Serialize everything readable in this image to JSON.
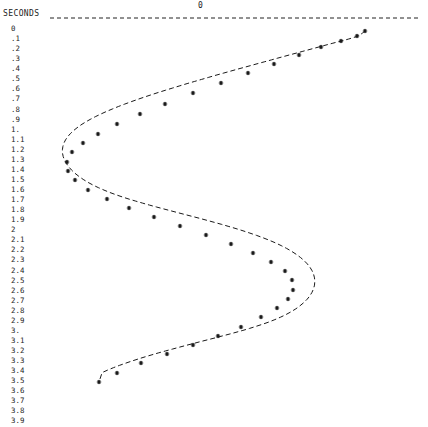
{
  "axis": {
    "y_title": "SECONDS",
    "zero_label": "0",
    "zero_line_y": 18,
    "zero_line_x_start": 50,
    "zero_line_x_end": 420,
    "y_ticks": [
      "0",
      ".1",
      ".2",
      ".3",
      ".4",
      ".5",
      ".6",
      ".7",
      ".8",
      ".9",
      "1.",
      "1.1",
      "1.2",
      "1.3",
      "1.4",
      "1.5",
      "1.6",
      "1.7",
      "1.8",
      "1.9",
      "2",
      "2.1",
      "2.2",
      "2.3",
      "2.4",
      "2.5",
      "2.6",
      "2.7",
      "2.8",
      "2.9",
      "3.",
      "3.1",
      "3.2",
      "3.3",
      "3.4",
      "3.5",
      "3.6",
      "3.7",
      "3.8",
      "3.9"
    ]
  },
  "colors": {
    "ink": "#232323",
    "background": "#ffffff",
    "curve": "#1a1a1a"
  },
  "chart_data": {
    "type": "line",
    "title": "",
    "xlabel": "",
    "ylabel": "SECONDS",
    "orientation": "vertical-time-axis",
    "marker": "asterisk",
    "line_style": "dashed",
    "grid": false,
    "legend": false,
    "note": "Damped sinusoid: amplitude on horizontal axis, time (seconds) increasing downward. Zero reference is the dashed line at top.",
    "xlim": [
      -1.0,
      1.0
    ],
    "ylim": [
      0,
      3.9
    ],
    "x": [
      0.0,
      0.1,
      0.2,
      0.3,
      0.4,
      0.5,
      0.6,
      0.7,
      0.8,
      0.9,
      1.0,
      1.1,
      1.2,
      1.3,
      1.4,
      1.5,
      1.6,
      1.7,
      1.8,
      1.9,
      2.0,
      2.1,
      2.2,
      2.3,
      2.4,
      2.5,
      2.6,
      2.7,
      2.8,
      2.9,
      3.0,
      3.1,
      3.2,
      3.3,
      3.4,
      3.5,
      3.6,
      3.7,
      3.8,
      3.9
    ],
    "values": [
      0.98,
      0.93,
      0.84,
      0.72,
      0.58,
      0.43,
      0.27,
      0.1,
      -0.07,
      -0.22,
      -0.35,
      -0.47,
      -0.57,
      -0.64,
      -0.69,
      -0.7,
      -0.68,
      -0.62,
      -0.53,
      -0.41,
      -0.27,
      -0.11,
      0.05,
      0.21,
      0.36,
      0.49,
      0.59,
      0.66,
      0.7,
      0.7,
      0.66,
      0.59,
      0.48,
      0.35,
      0.2,
      0.04,
      -0.12,
      -0.27,
      -0.41,
      -0.53
    ],
    "points_px": [
      [
        365,
        31
      ],
      [
        357,
        36
      ],
      [
        341,
        41
      ],
      [
        321,
        47
      ],
      [
        299,
        55
      ],
      [
        274,
        64
      ],
      [
        248,
        73
      ],
      [
        221,
        83
      ],
      [
        193,
        93
      ],
      [
        165,
        104
      ],
      [
        140,
        114
      ],
      [
        117,
        124
      ],
      [
        98,
        134
      ],
      [
        83,
        143
      ],
      [
        72,
        152
      ],
      [
        67,
        162
      ],
      [
        68,
        171
      ],
      [
        75,
        180
      ],
      [
        88,
        190
      ],
      [
        107,
        199
      ],
      [
        129,
        208
      ],
      [
        154,
        217
      ],
      [
        180,
        226
      ],
      [
        206,
        235
      ],
      [
        231,
        244
      ],
      [
        253,
        253
      ],
      [
        271,
        262
      ],
      [
        285,
        271
      ],
      [
        292,
        280
      ],
      [
        293,
        290
      ],
      [
        288,
        299
      ],
      [
        277,
        308
      ],
      [
        261,
        317
      ],
      [
        241,
        327
      ],
      [
        218,
        336
      ],
      [
        193,
        345
      ],
      [
        167,
        354
      ],
      [
        141,
        363
      ],
      [
        117,
        373
      ],
      [
        99,
        382
      ]
    ],
    "curve_px": [
      [
        365.0,
        31.0
      ],
      [
        363.9,
        31.9
      ],
      [
        362.7,
        32.9
      ],
      [
        361.3,
        33.9
      ],
      [
        359.7,
        35.0
      ],
      [
        358.0,
        36.0
      ],
      [
        355.1,
        37.0
      ],
      [
        352.0,
        38.0
      ],
      [
        348.7,
        39.0
      ],
      [
        345.2,
        40.0
      ],
      [
        341.5,
        41.0
      ],
      [
        337.3,
        42.0
      ],
      [
        332.9,
        43.2
      ],
      [
        328.3,
        44.4
      ],
      [
        323.5,
        45.7
      ],
      [
        318.5,
        47.1
      ],
      [
        313.2,
        48.5
      ],
      [
        307.8,
        50.0
      ],
      [
        302.1,
        51.5
      ],
      [
        296.3,
        53.1
      ],
      [
        290.3,
        54.7
      ],
      [
        284.1,
        56.4
      ],
      [
        277.8,
        58.1
      ],
      [
        271.4,
        59.9
      ],
      [
        264.8,
        61.7
      ],
      [
        258.1,
        63.5
      ],
      [
        251.3,
        65.4
      ],
      [
        244.4,
        67.3
      ],
      [
        237.4,
        69.2
      ],
      [
        230.3,
        71.2
      ],
      [
        223.2,
        73.2
      ],
      [
        216.0,
        75.2
      ],
      [
        208.8,
        77.3
      ],
      [
        201.6,
        79.4
      ],
      [
        194.3,
        81.5
      ],
      [
        187.1,
        83.6
      ],
      [
        179.9,
        85.8
      ],
      [
        172.7,
        88.0
      ],
      [
        165.6,
        90.2
      ],
      [
        158.5,
        92.4
      ],
      [
        151.5,
        94.7
      ],
      [
        144.6,
        97.0
      ],
      [
        137.9,
        99.3
      ],
      [
        131.2,
        101.7
      ],
      [
        124.7,
        104.1
      ],
      [
        118.4,
        106.5
      ],
      [
        112.3,
        109.0
      ],
      [
        106.4,
        111.5
      ],
      [
        100.7,
        114.1
      ],
      [
        95.3,
        116.7
      ],
      [
        90.2,
        119.4
      ],
      [
        85.4,
        122.1
      ],
      [
        81.0,
        124.9
      ],
      [
        77.0,
        127.8
      ],
      [
        73.4,
        130.7
      ],
      [
        70.3,
        133.7
      ],
      [
        67.6,
        136.8
      ],
      [
        65.5,
        139.9
      ],
      [
        63.9,
        143.1
      ],
      [
        62.9,
        146.4
      ],
      [
        62.4,
        149.8
      ],
      [
        62.5,
        153.2
      ],
      [
        63.2,
        156.6
      ],
      [
        64.5,
        160.0
      ],
      [
        66.3,
        163.4
      ],
      [
        68.7,
        166.8
      ],
      [
        71.6,
        170.1
      ],
      [
        75.0,
        173.3
      ],
      [
        78.9,
        176.4
      ],
      [
        83.2,
        179.4
      ],
      [
        87.9,
        182.3
      ],
      [
        92.9,
        185.0
      ],
      [
        98.3,
        187.6
      ],
      [
        104.0,
        190.1
      ],
      [
        109.9,
        192.5
      ],
      [
        116.1,
        194.8
      ],
      [
        122.5,
        197.0
      ],
      [
        129.0,
        199.1
      ],
      [
        135.7,
        201.1
      ],
      [
        142.5,
        203.1
      ],
      [
        149.5,
        205.1
      ],
      [
        156.5,
        207.0
      ],
      [
        163.6,
        208.9
      ],
      [
        170.8,
        210.8
      ],
      [
        178.0,
        212.7
      ],
      [
        185.3,
        214.6
      ],
      [
        192.6,
        216.5
      ],
      [
        199.9,
        218.4
      ],
      [
        207.2,
        220.4
      ],
      [
        214.5,
        222.4
      ],
      [
        221.7,
        224.4
      ],
      [
        228.9,
        226.5
      ],
      [
        236.0,
        228.6
      ],
      [
        243.0,
        230.8
      ],
      [
        249.9,
        233.1
      ],
      [
        256.6,
        235.4
      ],
      [
        263.1,
        237.8
      ],
      [
        269.4,
        240.3
      ],
      [
        275.5,
        242.9
      ],
      [
        281.2,
        245.6
      ],
      [
        286.6,
        248.4
      ],
      [
        291.6,
        251.3
      ],
      [
        296.2,
        254.3
      ],
      [
        300.4,
        257.4
      ],
      [
        304.1,
        260.6
      ],
      [
        307.3,
        263.9
      ],
      [
        310.0,
        267.3
      ],
      [
        312.1,
        270.8
      ],
      [
        313.6,
        274.3
      ],
      [
        314.5,
        277.9
      ],
      [
        314.8,
        281.5
      ],
      [
        314.5,
        285.1
      ],
      [
        313.6,
        288.7
      ],
      [
        312.0,
        292.3
      ],
      [
        309.9,
        295.8
      ],
      [
        307.2,
        299.2
      ],
      [
        303.9,
        302.5
      ],
      [
        300.1,
        305.7
      ],
      [
        295.9,
        308.8
      ],
      [
        291.2,
        311.7
      ],
      [
        286.1,
        314.5
      ],
      [
        280.7,
        317.1
      ],
      [
        274.9,
        319.6
      ],
      [
        268.9,
        322.0
      ],
      [
        262.7,
        324.2
      ],
      [
        256.2,
        326.3
      ],
      [
        249.6,
        328.4
      ],
      [
        242.9,
        330.4
      ],
      [
        236.0,
        332.3
      ],
      [
        229.1,
        334.2
      ],
      [
        222.1,
        336.0
      ],
      [
        215.1,
        337.9
      ],
      [
        208.0,
        339.7
      ],
      [
        200.9,
        341.5
      ],
      [
        193.8,
        343.4
      ],
      [
        186.8,
        345.2
      ],
      [
        179.7,
        347.1
      ],
      [
        172.7,
        349.0
      ],
      [
        165.7,
        350.9
      ],
      [
        158.8,
        352.8
      ],
      [
        151.9,
        354.8
      ],
      [
        145.2,
        356.8
      ],
      [
        138.5,
        358.9
      ],
      [
        132.0,
        361.0
      ],
      [
        125.6,
        363.2
      ],
      [
        119.4,
        365.4
      ],
      [
        113.4,
        367.7
      ],
      [
        107.6,
        370.1
      ],
      [
        102.1,
        372.6
      ],
      [
        99.0,
        382.0
      ]
    ]
  }
}
